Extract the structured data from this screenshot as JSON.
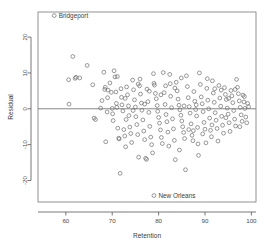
{
  "chart_data": {
    "type": "scatter",
    "title": "",
    "xlabel": "Retention",
    "ylabel": "Residual",
    "xlim": [
      54,
      101
    ],
    "ylim": [
      -26,
      27
    ],
    "xticks": [
      60,
      70,
      80,
      90,
      100
    ],
    "yticks": [
      20,
      10,
      0,
      -10,
      -20
    ],
    "xtick_labels": [
      "60",
      "70",
      "80",
      "90",
      "100"
    ],
    "ytick_labels": [
      "20",
      "10",
      "0",
      "-10",
      "-20"
    ],
    "grid": false,
    "legend": "none",
    "reference_line": {
      "axis": "horizontal",
      "value": 0,
      "color": "#666666"
    },
    "marker": {
      "shape": "open-circle",
      "radius": 1.9,
      "color": "#6d6d6d"
    },
    "annotations": [
      {
        "label": "Bridgeport",
        "x": 57.5,
        "y": 26.0,
        "marker": "open-circle"
      },
      {
        "label": "New Orleans",
        "x": 79.0,
        "y": -24.2,
        "marker": "open-circle"
      }
    ],
    "points": [
      [
        60.6,
        8.1
      ],
      [
        60.7,
        1.3
      ],
      [
        61.5,
        14.6
      ],
      [
        62.0,
        8.5
      ],
      [
        62.2,
        8.8
      ],
      [
        63.0,
        8.6
      ],
      [
        64.6,
        12.1
      ],
      [
        65.8,
        6.7
      ],
      [
        66.1,
        -2.6
      ],
      [
        66.4,
        -3.0
      ],
      [
        67.5,
        0.2
      ],
      [
        67.8,
        2.3
      ],
      [
        68.2,
        10.2
      ],
      [
        68.4,
        5.4
      ],
      [
        68.5,
        6.0
      ],
      [
        68.6,
        -9.2
      ],
      [
        68.9,
        -0.9
      ],
      [
        69.1,
        5.2
      ],
      [
        69.5,
        7.2
      ],
      [
        69.8,
        4.6
      ],
      [
        70.0,
        0.1
      ],
      [
        70.1,
        -1.4
      ],
      [
        70.2,
        -3.3
      ],
      [
        70.4,
        10.6
      ],
      [
        70.6,
        8.9
      ],
      [
        70.8,
        4.7
      ],
      [
        70.9,
        1.5
      ],
      [
        71.0,
        0.4
      ],
      [
        71.2,
        -5.4
      ],
      [
        71.4,
        -8.2
      ],
      [
        71.5,
        -8.4
      ],
      [
        71.7,
        -18.0
      ],
      [
        71.9,
        5.6
      ],
      [
        72.0,
        3.2
      ],
      [
        72.1,
        1.1
      ],
      [
        72.3,
        -0.6
      ],
      [
        72.5,
        -5.8
      ],
      [
        72.7,
        -7.6
      ],
      [
        72.9,
        -10.6
      ],
      [
        73.1,
        6.1
      ],
      [
        73.3,
        3.9
      ],
      [
        73.5,
        0.8
      ],
      [
        73.6,
        -1.9
      ],
      [
        73.8,
        -5.1
      ],
      [
        74.0,
        -6.9
      ],
      [
        74.2,
        -9.4
      ],
      [
        74.4,
        8.0
      ],
      [
        74.6,
        5.3
      ],
      [
        74.8,
        2.5
      ],
      [
        75.0,
        0.5
      ],
      [
        75.1,
        -2.2
      ],
      [
        75.3,
        -4.4
      ],
      [
        75.5,
        -7.2
      ],
      [
        75.7,
        -13.5
      ],
      [
        75.9,
        6.4
      ],
      [
        76.1,
        4.1
      ],
      [
        76.3,
        1.6
      ],
      [
        76.4,
        -0.4
      ],
      [
        76.6,
        -3.1
      ],
      [
        76.8,
        -6.2
      ],
      [
        77.0,
        -8.6
      ],
      [
        77.2,
        -13.8
      ],
      [
        77.4,
        -14.1
      ],
      [
        77.5,
        5.5
      ],
      [
        77.7,
        2.0
      ],
      [
        77.9,
        -1.0
      ],
      [
        78.1,
        -4.9
      ],
      [
        78.3,
        -7.9
      ],
      [
        78.5,
        -10.0
      ],
      [
        78.7,
        -12.3
      ],
      [
        78.9,
        9.8
      ],
      [
        79.1,
        6.6
      ],
      [
        79.3,
        4.3
      ],
      [
        79.5,
        2.8
      ],
      [
        79.7,
        0.9
      ],
      [
        79.8,
        -0.7
      ],
      [
        80.0,
        -2.4
      ],
      [
        80.2,
        -4.0
      ],
      [
        80.4,
        -5.9
      ],
      [
        80.6,
        -8.0
      ],
      [
        80.8,
        -9.7
      ],
      [
        81.0,
        10.1
      ],
      [
        81.2,
        4.5
      ],
      [
        81.4,
        1.2
      ],
      [
        81.6,
        -1.6
      ],
      [
        81.8,
        -3.6
      ],
      [
        82.0,
        -6.5
      ],
      [
        82.2,
        -10.4
      ],
      [
        82.4,
        9.6
      ],
      [
        82.6,
        3.5
      ],
      [
        82.8,
        0.3
      ],
      [
        83.0,
        -2.8
      ],
      [
        83.2,
        -5.6
      ],
      [
        83.4,
        -8.8
      ],
      [
        83.6,
        -14.2
      ],
      [
        83.8,
        7.4
      ],
      [
        84.0,
        5.0
      ],
      [
        84.2,
        2.7
      ],
      [
        84.4,
        1.0
      ],
      [
        84.6,
        -0.3
      ],
      [
        84.8,
        -1.8
      ],
      [
        85.0,
        -3.4
      ],
      [
        85.2,
        -5.0
      ],
      [
        85.4,
        -6.6
      ],
      [
        85.6,
        -8.3
      ],
      [
        85.8,
        -17.0
      ],
      [
        86.0,
        9.2
      ],
      [
        86.2,
        6.2
      ],
      [
        86.4,
        3.1
      ],
      [
        86.6,
        0.6
      ],
      [
        86.8,
        -1.2
      ],
      [
        87.0,
        -4.2
      ],
      [
        87.2,
        -7.4
      ],
      [
        87.4,
        -8.9
      ],
      [
        87.6,
        4.8
      ],
      [
        87.8,
        2.1
      ],
      [
        88.0,
        -0.2
      ],
      [
        88.2,
        -2.0
      ],
      [
        88.4,
        -5.2
      ],
      [
        88.6,
        -13.0
      ],
      [
        88.8,
        10.0
      ],
      [
        89.0,
        6.8
      ],
      [
        89.2,
        3.3
      ],
      [
        89.4,
        1.4
      ],
      [
        89.6,
        -0.8
      ],
      [
        89.8,
        -3.8
      ],
      [
        90.0,
        -5.7
      ],
      [
        90.2,
        -9.5
      ],
      [
        90.4,
        5.7
      ],
      [
        90.6,
        2.4
      ],
      [
        90.8,
        0.0
      ],
      [
        91.0,
        -2.6
      ],
      [
        91.2,
        -6.0
      ],
      [
        91.4,
        -7.8
      ],
      [
        91.6,
        7.8
      ],
      [
        91.8,
        4.4
      ],
      [
        92.0,
        1.8
      ],
      [
        92.2,
        -1.1
      ],
      [
        92.4,
        -3.2
      ],
      [
        92.6,
        -5.5
      ],
      [
        92.8,
        -9.0
      ],
      [
        93.0,
        6.5
      ],
      [
        93.2,
        3.0
      ],
      [
        93.4,
        0.7
      ],
      [
        93.6,
        -2.1
      ],
      [
        93.8,
        -4.6
      ],
      [
        94.0,
        -6.8
      ],
      [
        94.2,
        5.9
      ],
      [
        94.4,
        4.0
      ],
      [
        94.6,
        2.6
      ],
      [
        94.8,
        0.2
      ],
      [
        95.0,
        -1.5
      ],
      [
        95.2,
        -3.9
      ],
      [
        95.4,
        -6.3
      ],
      [
        95.6,
        5.1
      ],
      [
        95.8,
        3.6
      ],
      [
        96.0,
        1.7
      ],
      [
        96.2,
        -0.5
      ],
      [
        96.4,
        -2.9
      ],
      [
        96.6,
        -4.8
      ],
      [
        96.8,
        8.2
      ],
      [
        97.0,
        6.0
      ],
      [
        97.2,
        4.2
      ],
      [
        97.4,
        2.2
      ],
      [
        97.6,
        0.4
      ],
      [
        97.8,
        -1.7
      ],
      [
        98.0,
        -3.5
      ],
      [
        98.2,
        3.8
      ],
      [
        98.4,
        1.9
      ],
      [
        98.6,
        0.1
      ],
      [
        98.8,
        -2.3
      ],
      [
        99.0,
        -3.9
      ],
      [
        99.2,
        1.5
      ],
      [
        73.0,
        -3.0
      ],
      [
        74.5,
        -0.5
      ],
      [
        76.0,
        8.3
      ],
      [
        78.0,
        4.9
      ],
      [
        82.5,
        7.0
      ],
      [
        84.5,
        -11.5
      ],
      [
        86.5,
        -5.8
      ],
      [
        88.5,
        -9.8
      ],
      [
        90.5,
        8.4
      ],
      [
        93.5,
        5.2
      ],
      [
        96.5,
        5.4
      ],
      [
        98.5,
        3.4
      ],
      [
        69.0,
        3.1
      ],
      [
        71.1,
        9.0
      ],
      [
        75.6,
        6.9
      ],
      [
        79.0,
        7.1
      ],
      [
        81.5,
        6.4
      ],
      [
        83.5,
        5.8
      ],
      [
        85.5,
        0.8
      ],
      [
        87.5,
        -6.1
      ],
      [
        89.5,
        -7.0
      ],
      [
        91.5,
        -4.5
      ],
      [
        94.5,
        -2.5
      ],
      [
        97.5,
        -5.0
      ],
      [
        72.8,
        2.9
      ],
      [
        77.0,
        1.3
      ],
      [
        80.5,
        3.9
      ],
      [
        84.9,
        8.6
      ],
      [
        88.1,
        1.1
      ],
      [
        92.1,
        5.6
      ],
      [
        95.1,
        2.9
      ],
      [
        99.4,
        0.6
      ]
    ]
  },
  "plot_geometry": {
    "frame_left_px": 38,
    "frame_right_px": 256,
    "frame_top_px": 12,
    "frame_bottom_px": 202
  }
}
